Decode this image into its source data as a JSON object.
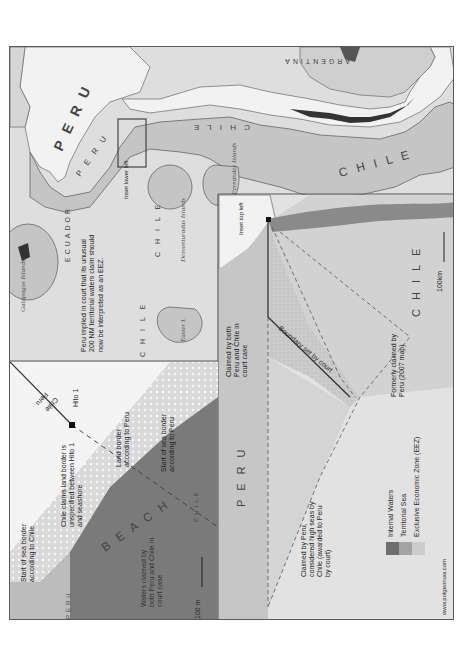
{
  "map": {
    "orientation": "rotated 90° counter-clockwise",
    "colors": {
      "background": "#dedede",
      "land": "#f2f2f2",
      "eez": "#c9c9c9",
      "territorial_sea": "#a9a9a9",
      "internal_waters": "#777777",
      "beach": "#e9e9e9",
      "border": "#555555",
      "frame": "#5a5a5a"
    },
    "overview": {
      "country_labels": [
        "PERU",
        "PERU",
        "CHILE",
        "CHILE",
        "CHILE",
        "CHILE",
        "ARGENTINA",
        "ECUADOR"
      ],
      "labels": {
        "peru_land": "P E R U",
        "peru_sea": "P E R U",
        "chile_coast": "C H I L E",
        "chile_sea": "C H I L E",
        "argentina": "ARGENTINA",
        "ecuador": "ECUADOR",
        "chile_desventuradas": "C H I L E",
        "chile_easter": "C H I L E"
      },
      "islands": {
        "galapagos": "Galápagos Islands",
        "desventuradas": "Desventuradas Islands",
        "san_fernandez": "San Fernández Islands",
        "easter": "Easter I."
      },
      "notes": {
        "peru_claim": "Peru implied in court that its unusual 200 NM territorial waters claim should now be interpreted as an EEZ.",
        "antarctica": "Chile's territorial claims in Antarctica not shown",
        "inset_lower_left": "Inset lower left"
      }
    },
    "inset_beach": {
      "labels": {
        "start_sea_chile": "Start of sea border according to Chile",
        "chile_claims": "Chile claims land border is unspecified between Hito 1 and seashore",
        "land_border_peru": "Land border according to Peru",
        "start_sea_peru": "Start of sea border according to Peru",
        "hito": "Hito 1",
        "peru_side": "Peru",
        "chile_side": "Chile",
        "beach": "B E A C H",
        "waters_claimed": "Waters claimed by both Peru and Chile in court case",
        "peru_small": "PERU",
        "chile_small": "CHILE",
        "scale": "100 m"
      }
    },
    "inset_dispute": {
      "labels": {
        "inset_top_left": "Inset top left",
        "claimed_both": "Claimed by both Peru and Chile in court case",
        "boundary": "Boundary set by court",
        "formerly": "Formerly claimed by Peru (2007 map)",
        "high_seas": "Claimed by Peru, considered high seas by Chile (awarded to Peru by court)",
        "peru": "P E R U",
        "chile": "C H I L E",
        "scale": "100km"
      }
    },
    "legend": {
      "items": [
        {
          "label": "Internal Waters",
          "color": "#6e6e6e"
        },
        {
          "label": "Territorial Sea",
          "color": "#a3a3a3"
        },
        {
          "label": "Exclusive Economic Zone (EEZ)",
          "color": "#cdcdcd"
        }
      ]
    },
    "credit": "www.polgeonow.com"
  }
}
